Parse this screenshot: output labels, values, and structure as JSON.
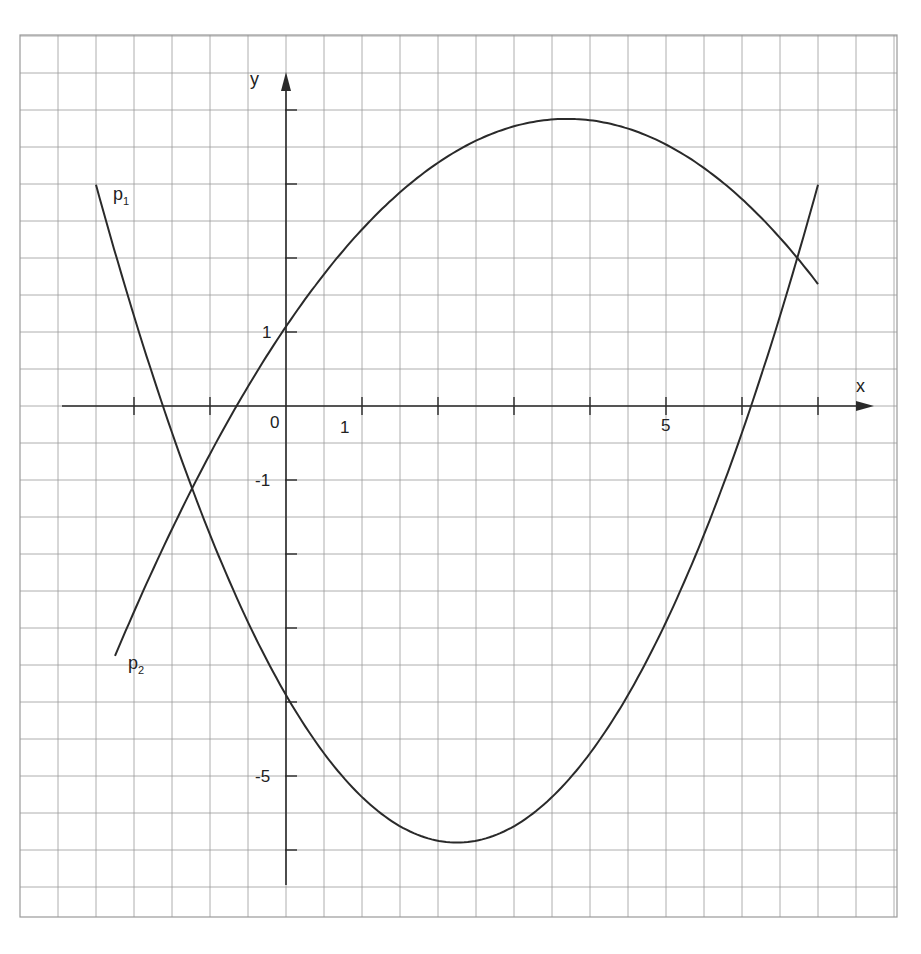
{
  "chart_data": {
    "type": "line",
    "title": "",
    "xlabel": "x",
    "ylabel": "y",
    "grid": true,
    "x_axis": {
      "range": [
        -2.9,
        7.7
      ],
      "ticks": [
        -2,
        -1,
        1,
        2,
        3,
        4,
        5,
        6,
        7
      ],
      "tick_labels": {
        "0": "0",
        "1": "1",
        "5": "5"
      }
    },
    "y_axis": {
      "range": [
        -6.5,
        4.4
      ],
      "ticks": [
        4,
        3,
        2,
        1,
        -1,
        -2,
        -3,
        -4,
        -5,
        -6
      ],
      "tick_labels": {
        "1": "1",
        "-1": "-1",
        "-5": "-5"
      }
    },
    "origin_label": "0",
    "series": [
      {
        "name": "p1",
        "label": "p₁",
        "kind": "parabola (opens upward)",
        "formula_estimate": "y = 0.394(x - 2.25)^2 - 5.9",
        "x_domain": [
          -2.5,
          7
        ],
        "key_points": [
          {
            "x": -2.5,
            "y": 3.0
          },
          {
            "x": -1.2,
            "y": -1.1
          },
          {
            "x": 0,
            "y": -3.9
          },
          {
            "x": 2.25,
            "y": -5.9
          },
          {
            "x": 6.1,
            "y": 0
          },
          {
            "x": 7,
            "y": 3.0
          }
        ]
      },
      {
        "name": "p2",
        "label": "p₂",
        "kind": "parabola (opens downward)",
        "formula_estimate": "y = -0.205(x - 3.7)^2 + 3.88",
        "x_domain": [
          -2.25,
          7
        ],
        "key_points": [
          {
            "x": -2.25,
            "y": -3.45
          },
          {
            "x": -1.2,
            "y": -1.1
          },
          {
            "x": -0.9,
            "y": 0
          },
          {
            "x": 0,
            "y": 1
          },
          {
            "x": 3.7,
            "y": 3.88
          },
          {
            "x": 6.7,
            "y": 2.0
          },
          {
            "x": 7,
            "y": 1.8
          }
        ]
      }
    ],
    "intersections": [
      {
        "x": -1.2,
        "y": -1.1
      },
      {
        "x": 6.7,
        "y": 2.0
      }
    ]
  },
  "labels": {
    "x_axis": "x",
    "y_axis": "y",
    "origin": "0",
    "x_one": "1",
    "x_five": "5",
    "y_one": "1",
    "y_minus_one": "-1",
    "y_minus_five": "-5",
    "p1": "p",
    "p1_sub": "1",
    "p2": "p",
    "p2_sub": "2"
  },
  "colors": {
    "grid": "#9a9a9a",
    "axis": "#2a2a2a",
    "curve": "#2a2a2a",
    "background": "#ffffff"
  }
}
